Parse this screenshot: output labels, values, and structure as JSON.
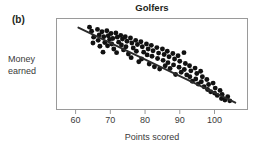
{
  "figure": {
    "panel_label": "(b)",
    "title": "Golfers",
    "background_color": "#ffffff"
  },
  "chart_data": {
    "type": "scatter",
    "title": "Golfers",
    "panel": "(b)",
    "xlabel": "Points scored",
    "ylabel": "Money earned",
    "xticks": [
      60,
      70,
      80,
      90,
      100
    ],
    "xtick_labels": [
      "60",
      "70",
      "80",
      "90",
      "100"
    ],
    "yticks": [],
    "ytick_labels": [],
    "xlim": [
      54.5,
      109.5
    ],
    "ylim": [
      0,
      100
    ],
    "grid": false,
    "legend": null,
    "marker_color": "#111111",
    "marker_shape": "circle",
    "frame_color": "#9a9a9a",
    "trendline": {
      "visible": true,
      "color": "#2b2b2b",
      "x": [
        60.8,
        106.0
      ],
      "y": [
        90.0,
        7.5
      ],
      "description": "negative linear fit"
    },
    "correlation": "strong negative",
    "points": [
      [
        64.0,
        90.5
      ],
      [
        64.6,
        86.0
      ],
      [
        65.2,
        79.5
      ],
      [
        65.0,
        73.0
      ],
      [
        66.3,
        88.0
      ],
      [
        66.8,
        82.0
      ],
      [
        66.5,
        76.0
      ],
      [
        67.0,
        69.5
      ],
      [
        67.6,
        85.5
      ],
      [
        68.1,
        80.0
      ],
      [
        68.4,
        73.5
      ],
      [
        67.9,
        63.0
      ],
      [
        69.0,
        86.5
      ],
      [
        69.4,
        81.0
      ],
      [
        69.8,
        77.0
      ],
      [
        69.2,
        70.0
      ],
      [
        70.2,
        83.5
      ],
      [
        70.7,
        78.0
      ],
      [
        70.4,
        72.0
      ],
      [
        71.0,
        66.5
      ],
      [
        71.6,
        84.0
      ],
      [
        72.0,
        79.5
      ],
      [
        72.4,
        74.0
      ],
      [
        71.8,
        62.5
      ],
      [
        73.0,
        81.5
      ],
      [
        73.5,
        77.5
      ],
      [
        73.2,
        71.0
      ],
      [
        73.8,
        65.5
      ],
      [
        74.3,
        80.0
      ],
      [
        74.8,
        75.0
      ],
      [
        74.5,
        69.0
      ],
      [
        75.2,
        61.0
      ],
      [
        75.8,
        78.5
      ],
      [
        76.2,
        73.0
      ],
      [
        76.6,
        67.5
      ],
      [
        76.0,
        57.0
      ],
      [
        77.3,
        76.0
      ],
      [
        77.8,
        71.5
      ],
      [
        77.5,
        64.0
      ],
      [
        78.2,
        52.5
      ],
      [
        78.8,
        74.5
      ],
      [
        79.2,
        69.0
      ],
      [
        79.6,
        63.0
      ],
      [
        79.0,
        55.5
      ],
      [
        80.4,
        72.0
      ],
      [
        80.9,
        66.5
      ],
      [
        80.6,
        60.0
      ],
      [
        81.2,
        50.0
      ],
      [
        81.8,
        70.5
      ],
      [
        82.3,
        64.5
      ],
      [
        82.0,
        58.5
      ],
      [
        82.7,
        47.0
      ],
      [
        83.4,
        68.0
      ],
      [
        83.9,
        62.0
      ],
      [
        83.6,
        56.0
      ],
      [
        84.2,
        44.5
      ],
      [
        85.0,
        66.5
      ],
      [
        85.5,
        60.5
      ],
      [
        85.2,
        54.0
      ],
      [
        85.8,
        48.0
      ],
      [
        86.4,
        64.0
      ],
      [
        86.9,
        58.0
      ],
      [
        86.6,
        51.5
      ],
      [
        87.2,
        45.0
      ],
      [
        88.0,
        61.5
      ],
      [
        88.5,
        55.5
      ],
      [
        88.2,
        49.0
      ],
      [
        88.8,
        38.5
      ],
      [
        89.5,
        59.0
      ],
      [
        90.0,
        53.0
      ],
      [
        89.8,
        46.5
      ],
      [
        90.4,
        41.0
      ],
      [
        91.2,
        62.5
      ],
      [
        91.6,
        50.5
      ],
      [
        91.3,
        44.0
      ],
      [
        92.0,
        38.0
      ],
      [
        92.8,
        48.0
      ],
      [
        93.2,
        42.5
      ],
      [
        92.9,
        36.0
      ],
      [
        93.6,
        31.0
      ],
      [
        94.4,
        45.5
      ],
      [
        94.9,
        39.5
      ],
      [
        94.6,
        33.5
      ],
      [
        95.3,
        28.0
      ],
      [
        96.0,
        42.0
      ],
      [
        96.5,
        36.0
      ],
      [
        96.2,
        30.5
      ],
      [
        97.0,
        25.0
      ],
      [
        97.8,
        33.0
      ],
      [
        98.3,
        27.5
      ],
      [
        98.0,
        22.0
      ],
      [
        98.9,
        19.5
      ],
      [
        99.6,
        29.0
      ],
      [
        100.2,
        23.5
      ],
      [
        100.0,
        18.0
      ],
      [
        100.8,
        15.5
      ],
      [
        101.6,
        21.0
      ],
      [
        102.2,
        16.5
      ],
      [
        102.0,
        12.0
      ],
      [
        103.0,
        10.5
      ],
      [
        103.8,
        14.0
      ],
      [
        104.4,
        9.5
      ]
    ]
  }
}
